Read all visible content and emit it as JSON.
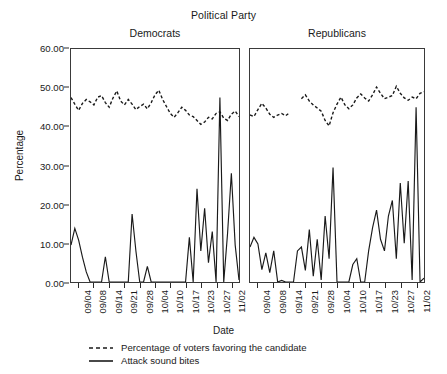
{
  "chart_data": {
    "type": "line",
    "title": "Political Party",
    "xlabel": "Date",
    "ylabel": "Percentage",
    "ylim": [
      0,
      60
    ],
    "yticks": [
      "0.00",
      "10.00",
      "20.00",
      "30.00",
      "40.00",
      "50.00",
      "60.00"
    ],
    "ytick_values": [
      0,
      10,
      20,
      30,
      40,
      50,
      60
    ],
    "grid": false,
    "legend_position": "bottom",
    "panels": [
      {
        "name": "Democrats",
        "categories": [
          "09/04",
          "09/08",
          "09/14",
          "09/21",
          "09/28",
          "10/04",
          "10/10",
          "10/17",
          "10/23",
          "10/27",
          "11/02"
        ],
        "x": [
          0,
          1,
          2,
          3,
          4,
          5,
          6,
          7,
          8,
          9,
          10,
          11,
          12,
          13,
          14,
          15,
          16,
          17,
          18,
          19,
          20,
          21,
          22,
          23,
          24,
          25,
          26,
          27,
          28,
          29,
          30,
          31,
          32,
          33,
          34,
          35,
          36,
          37,
          38,
          39,
          40,
          41,
          42,
          43,
          44
        ],
        "series": [
          {
            "name": "Percentage of voters favoring the candidate",
            "style": "dashed",
            "values": [
              47.5,
              45.8,
              44.2,
              46.0,
              47.0,
              46.4,
              45.6,
              47.6,
              48.0,
              46.2,
              45.0,
              47.4,
              49.2,
              46.6,
              45.6,
              47.0,
              45.8,
              44.4,
              45.2,
              45.8,
              44.6,
              46.2,
              48.2,
              49.4,
              47.0,
              45.2,
              43.4,
              42.4,
              43.6,
              45.0,
              44.2,
              43.0,
              42.6,
              41.6,
              40.6,
              41.2,
              42.4,
              42.0,
              43.4,
              43.8,
              42.2,
              41.6,
              43.2,
              44.0,
              42.6
            ]
          },
          {
            "name": "Attack sound bites",
            "style": "solid",
            "values": [
              9.5,
              13.8,
              10.8,
              6.4,
              2.6,
              0.0,
              0.0,
              0.0,
              0.0,
              6.5,
              0.0,
              0.0,
              0.0,
              0.0,
              0.0,
              0.0,
              17.5,
              8.0,
              0.0,
              0.0,
              4.0,
              0.0,
              0.0,
              0.0,
              0.0,
              0.0,
              0.0,
              0.0,
              0.0,
              0.0,
              0.0,
              11.5,
              0.0,
              24.0,
              8.0,
              19.0,
              5.0,
              13.0,
              0.0,
              47.5,
              0.0,
              12.5,
              28.0,
              9.5,
              0.5
            ]
          }
        ]
      },
      {
        "name": "Republicans",
        "categories": [
          "09/04",
          "09/08",
          "09/14",
          "09/21",
          "09/28",
          "10/04",
          "10/10",
          "10/17",
          "10/23",
          "10/27",
          "11/02"
        ],
        "x": [
          0,
          1,
          2,
          3,
          4,
          5,
          6,
          7,
          8,
          9,
          10,
          11,
          12,
          13,
          14,
          15,
          16,
          17,
          18,
          19,
          20,
          21,
          22,
          23,
          24,
          25,
          26,
          27,
          28,
          29,
          30,
          31,
          32,
          33,
          34,
          35,
          36,
          37,
          38,
          39,
          40,
          41,
          42,
          43,
          44
        ],
        "series": [
          {
            "name": "Percentage of voters favoring the candidate",
            "style": "dashed",
            "values": [
              43.0,
              42.6,
              44.4,
              46.0,
              44.8,
              43.2,
              42.4,
              43.0,
              43.4,
              42.8,
              43.6,
              null,
              null,
              47.2,
              48.2,
              46.6,
              45.6,
              44.8,
              44.0,
              41.6,
              40.2,
              43.6,
              45.8,
              47.6,
              45.6,
              44.6,
              45.6,
              47.4,
              48.4,
              47.4,
              46.6,
              48.2,
              50.2,
              48.6,
              47.2,
              47.6,
              48.0,
              50.4,
              48.6,
              47.4,
              46.8,
              47.6,
              47.2,
              48.6,
              49.0
            ]
          },
          {
            "name": "Attack sound bites",
            "style": "solid",
            "values": [
              9.0,
              11.5,
              9.8,
              3.2,
              7.5,
              2.4,
              8.0,
              0.0,
              0.4,
              0.0,
              0.0,
              0.0,
              8.0,
              9.0,
              3.0,
              13.5,
              1.5,
              11.0,
              0.5,
              17.0,
              6.0,
              29.5,
              0.0,
              0.0,
              0.0,
              0.0,
              4.5,
              6.0,
              0.0,
              0.0,
              8.0,
              14.0,
              18.5,
              11.0,
              8.0,
              17.0,
              21.0,
              6.0,
              25.5,
              10.0,
              26.0,
              0.5,
              45.0,
              0.0,
              1.0
            ]
          }
        ]
      }
    ],
    "legend": [
      {
        "label": "Percentage of voters favoring the candidate",
        "style": "dashed"
      },
      {
        "label": "Attack sound bites",
        "style": "solid"
      }
    ]
  }
}
